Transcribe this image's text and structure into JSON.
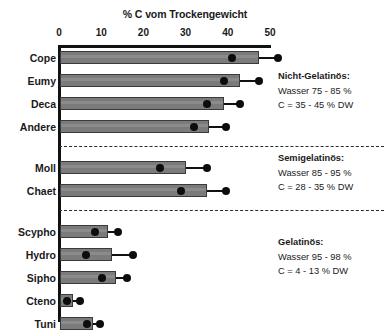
{
  "chart_data": {
    "type": "bar",
    "orientation": "horizontal",
    "title": "% C vom Trockengewicht",
    "xlabel": "% C vom Trockengewicht",
    "ylabel": "",
    "xlim": [
      0,
      50
    ],
    "xticks": [
      0,
      10,
      20,
      30,
      40,
      50
    ],
    "xticklabels": [
      "0",
      "10",
      "20",
      "30",
      "40",
      "50"
    ],
    "grid": false,
    "legend": null,
    "categories": [
      "Cope",
      "Eumy",
      "Deca",
      "Andere",
      "Moll",
      "Chaet",
      "Scypho",
      "Hydro",
      "Sipho",
      "Cteno",
      "Tuni"
    ],
    "values": [
      47.4,
      43.0,
      39.0,
      35.5,
      30.0,
      35.0,
      11.7,
      12.6,
      13.6,
      3.3,
      8.0
    ],
    "series": [
      {
        "name": "Balkenwert (% C vom Trockengewicht)",
        "values": [
          47.4,
          43.0,
          39.0,
          35.5,
          30.0,
          35.0,
          11.7,
          12.6,
          13.6,
          3.3,
          8.0
        ]
      },
      {
        "name": "Markerpunkt (Mittelwert)",
        "values": [
          41.0,
          39.0,
          35.0,
          32.0,
          24.0,
          29.0,
          8.6,
          6.4,
          10.2,
          2.0,
          6.6
        ]
      },
      {
        "name": "Fehlerbalken-Endpunkt (Maximum)",
        "values": [
          52.0,
          47.5,
          42.8,
          39.5,
          35.0,
          39.5,
          14.0,
          17.6,
          16.0,
          5.0,
          9.8
        ]
      }
    ],
    "bars": [
      {
        "label": "Cope",
        "value": 47.4,
        "dot": 41.0,
        "whisker_end": 52.0,
        "group": "nicht-gelatinoes"
      },
      {
        "label": "Eumy",
        "value": 43.0,
        "dot": 39.0,
        "whisker_end": 47.5,
        "group": "nicht-gelatinoes"
      },
      {
        "label": "Deca",
        "value": 39.0,
        "dot": 35.0,
        "whisker_end": 42.8,
        "group": "nicht-gelatinoes"
      },
      {
        "label": "Andere",
        "value": 35.5,
        "dot": 32.0,
        "whisker_end": 39.5,
        "group": "nicht-gelatinoes"
      },
      {
        "label": "Moll",
        "value": 30.0,
        "dot": 24.0,
        "whisker_end": 35.0,
        "group": "semigelatinoes"
      },
      {
        "label": "Chaet",
        "value": 35.0,
        "dot": 29.0,
        "whisker_end": 39.5,
        "group": "semigelatinoes"
      },
      {
        "label": "Scypho",
        "value": 11.7,
        "dot": 8.6,
        "whisker_end": 14.0,
        "group": "gelatinoes"
      },
      {
        "label": "Hydro",
        "value": 12.6,
        "dot": 6.4,
        "whisker_end": 17.6,
        "group": "gelatinoes"
      },
      {
        "label": "Sipho",
        "value": 13.6,
        "dot": 10.2,
        "whisker_end": 16.0,
        "group": "gelatinoes"
      },
      {
        "label": "Cteno",
        "value": 3.3,
        "dot": 2.0,
        "whisker_end": 5.0,
        "group": "gelatinoes"
      },
      {
        "label": "Tuni",
        "value": 8.0,
        "dot": 6.6,
        "whisker_end": 9.8,
        "group": "gelatinoes"
      }
    ],
    "annotations": [
      {
        "id": "nicht-gelatinoes",
        "title": "Nicht-Gelatinös:",
        "line1": "Wasser 75 - 85 %",
        "line2": "C = 35 - 45 % DW"
      },
      {
        "id": "semigelatinoes",
        "title": "Semigelatinös:",
        "line1": "Wasser 85 - 95 %",
        "line2": "C = 28 - 35 % DW"
      },
      {
        "id": "gelatinoes",
        "title": "Gelatinös:",
        "line1": "Wasser 95 - 98 %",
        "line2": "C = 4 - 13 % DW"
      }
    ],
    "colors": {
      "bar_fill": "#7b7b7b",
      "bar_edge": "#3a3a3a",
      "marker": "#0d0d0d",
      "axis": "#111111",
      "separator": "#2b2b2b",
      "background": "#ffffff"
    }
  }
}
